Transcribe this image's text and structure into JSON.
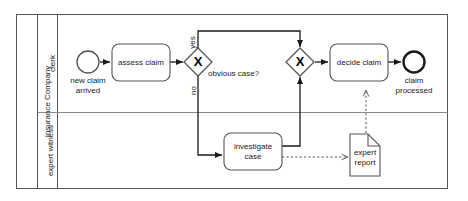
{
  "diagram": {
    "type": "bpmn-process",
    "pool": {
      "name": "Insurance Company",
      "lanes": [
        {
          "id": "lane-clerk",
          "name": "clerk"
        },
        {
          "id": "lane-expert-witness",
          "name": "expert witness"
        }
      ]
    },
    "events": [
      {
        "id": "start-new-claim-arrived",
        "kind": "start-event",
        "label": "new claim\narrived",
        "lane": "clerk"
      },
      {
        "id": "end-claim-processed",
        "kind": "end-event",
        "label": "claim\nprocessed",
        "lane": "clerk"
      }
    ],
    "tasks": [
      {
        "id": "task-assess-claim",
        "label": "assess claim",
        "lane": "clerk"
      },
      {
        "id": "task-decide-claim",
        "label": "decide claim",
        "lane": "clerk"
      },
      {
        "id": "task-investigate-case",
        "label": "investigate\ncase",
        "lane": "expert witness"
      }
    ],
    "gateways": [
      {
        "id": "gateway-obvious-case",
        "kind": "exclusive-gateway",
        "symbol": "X",
        "label": "obvious case?",
        "lane": "clerk"
      },
      {
        "id": "gateway-merge",
        "kind": "exclusive-gateway",
        "symbol": "X",
        "label": "",
        "lane": "clerk"
      }
    ],
    "data_objects": [
      {
        "id": "data-expert-report",
        "label": "expert\nreport",
        "lane": "expert witness"
      }
    ],
    "flow_labels": {
      "yes": "yes",
      "no": "no"
    },
    "colors": {
      "stroke": "#1a1a1a",
      "shape_stroke": "#555555",
      "fill": "#ffffff",
      "lane_line": "#888888",
      "background": "#ffffff"
    }
  }
}
